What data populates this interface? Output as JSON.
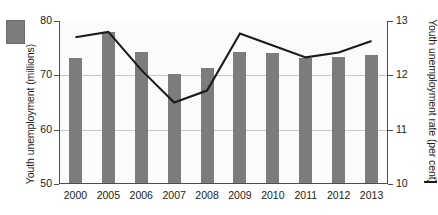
{
  "chart_data": {
    "type": "bar",
    "title": "",
    "subtitle": "",
    "xlabel": "",
    "categories": [
      "2000",
      "2005",
      "2006",
      "2007",
      "2008",
      "2009",
      "2010",
      "2011",
      "2012",
      "2013"
    ],
    "grid": true,
    "legend_position": "outside-left-and-right",
    "series": [
      {
        "name": "Youth unemployment (millions)",
        "type": "bar",
        "axis": "left",
        "color": "#7c7c7c",
        "values": [
          73.0,
          77.8,
          74.1,
          70.0,
          71.1,
          74.2,
          74.0,
          73.0,
          73.2,
          73.6
        ]
      },
      {
        "name": "Youth unemployment rate (per cent)",
        "type": "line",
        "axis": "right",
        "color": "#1b1b1b",
        "values": [
          12.7,
          12.8,
          12.1,
          11.5,
          11.72,
          12.77,
          12.55,
          12.33,
          12.42,
          12.63
        ]
      }
    ],
    "left_axis": {
      "label": "Youth unemployment (millions)",
      "ylim": [
        50,
        80
      ],
      "ticks": [
        "50",
        "60",
        "70",
        "80"
      ],
      "tick_values": [
        50,
        60,
        70,
        80
      ]
    },
    "right_axis": {
      "label": "Youth unemployment rate (per cent)",
      "ylim": [
        10,
        13
      ],
      "ticks": [
        "10",
        "11",
        "12",
        "13"
      ],
      "tick_values": [
        10,
        11,
        12,
        13
      ]
    }
  },
  "legend": {
    "bar_swatch_name": "bar-series-swatch",
    "line_mark_name": "line-series-mark"
  }
}
